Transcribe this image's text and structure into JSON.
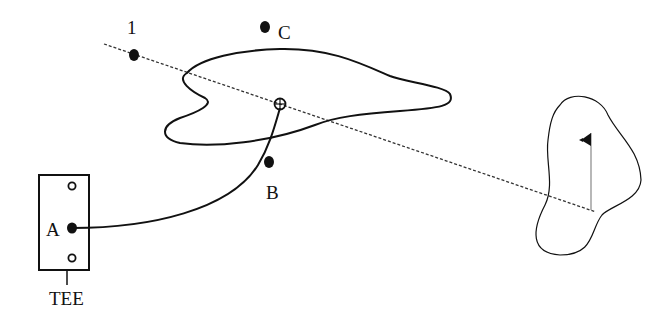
{
  "diagram": {
    "type": "golf-hole-layout",
    "labels": {
      "point_1": "1",
      "point_a": "A",
      "point_b": "B",
      "point_c": "C",
      "tee": "TEE"
    },
    "elements": {
      "tee_box": "tee-box",
      "water_hazard": "water-hazard",
      "green": "green",
      "flag": "flag-pin",
      "ball_landing": "ball-marker",
      "shot_path": "curved-shot-path",
      "target_line": "dashed-target-line"
    },
    "colors": {
      "ink": "#111111",
      "background": "#ffffff",
      "pin": "#888888"
    }
  }
}
